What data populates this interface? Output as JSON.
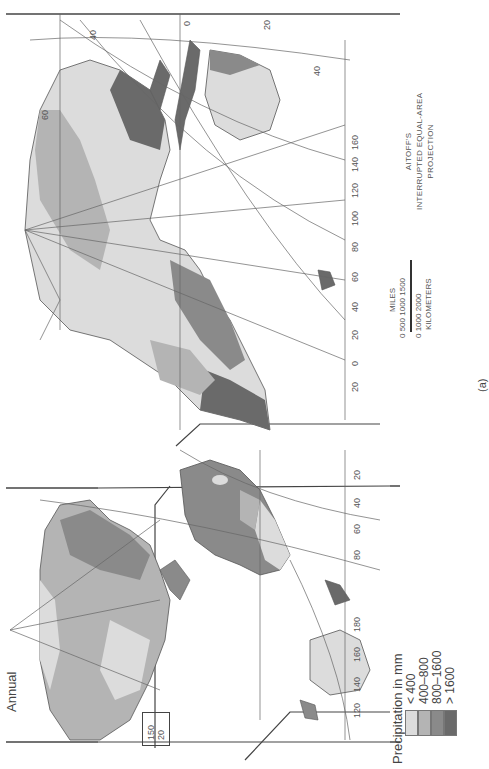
{
  "figure": {
    "title": "Annual",
    "label": "(a)"
  },
  "legend": {
    "title": "Precipitation in mm",
    "items": [
      {
        "label": "< 400",
        "color": "#dcdcdc"
      },
      {
        "label": "400–800",
        "color": "#b4b4b4"
      },
      {
        "label": "800–1600",
        "color": "#8a8a8a"
      },
      {
        "label": "> 1600",
        "color": "#6a6a6a"
      }
    ]
  },
  "projection": {
    "line1": "AITOFF'S",
    "line2": "INTERRUPTED EQUAL-AREA",
    "line3": "PROJECTION"
  },
  "scale_bar": {
    "miles_label": "MILES",
    "miles_ticks": "0   500 1000 1500",
    "km_ticks": "0   1000  2000",
    "km_label": "KILOMETERS"
  },
  "graticule_labels": {
    "eastern_top": [
      "40",
      "60",
      "20",
      "0",
      "20",
      "40"
    ],
    "eastern_longitudes": [
      "20",
      "40",
      "60",
      "80",
      "100",
      "120",
      "140",
      "160",
      "60"
    ],
    "eastern_bottom": [
      "0",
      "20",
      "60"
    ],
    "western_longitudes": [
      "120",
      "140",
      "160",
      "180",
      "100",
      "0",
      "0",
      "160"
    ],
    "south_america": [
      "20",
      "40",
      "60",
      "80",
      "20",
      "40",
      "60",
      "40",
      "20"
    ],
    "pole_fan_europe": [
      "80",
      "160",
      "180",
      "120",
      "80",
      "40",
      "0",
      "40"
    ],
    "pole_fan_america": [
      "20",
      "60",
      "100",
      "140",
      "80"
    ],
    "inset": [
      "150",
      "20"
    ],
    "pacific": [
      "120",
      "140",
      "160",
      "180",
      "40",
      "20"
    ]
  },
  "colors": {
    "lt400": "#dcdcdc",
    "r400_800": "#b4b4b4",
    "r800_1600": "#8a8a8a",
    "gt1600": "#6a6a6a",
    "ocean": "#ffffff",
    "line": "#555555"
  }
}
